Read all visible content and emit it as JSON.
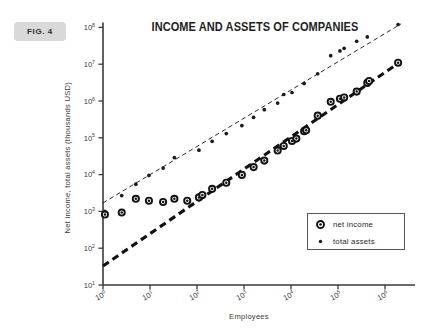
{
  "figure": {
    "badge_label": "FIG. 4",
    "title": "INCOME AND ASSETS OF COMPANIES"
  },
  "legend": {
    "position": "bottom-right",
    "entries": [
      {
        "label": "net income",
        "marker": "open-circle-donut",
        "color": "#111111"
      },
      {
        "label": "total assets",
        "marker": "small-filled-dot",
        "color": "#1a1a1a"
      }
    ]
  },
  "colors": {
    "background": "#ffffff",
    "axis": "#3a3a3a",
    "badge_fill": "#d9d9d9",
    "net_income": "#111111",
    "total_assets": "#1a1a1a"
  },
  "axes": {
    "x": {
      "label": "Employees",
      "scale": "log10",
      "min_exp": 0,
      "max_exp": 6,
      "tick_labels": [
        "10^0",
        "10^1",
        "10^2",
        "10^3",
        "10^4",
        "10^5",
        "10^6"
      ],
      "tick_mantissa": [
        "10",
        "10",
        "10",
        "10",
        "10",
        "10",
        "10"
      ],
      "tick_exponents": [
        "0",
        "1",
        "2",
        "3",
        "4",
        "5",
        "6"
      ]
    },
    "y": {
      "label": "Net income, total assets (thousands USD)",
      "scale": "log10",
      "min_exp": 1,
      "max_exp": 8,
      "tick_labels": [
        "10^8",
        "10^7",
        "10^6",
        "10^5",
        "10^4",
        "10^3",
        "10^2",
        "10^1"
      ],
      "tick_mantissa": [
        "10",
        "10",
        "10",
        "10",
        "10",
        "10",
        "10",
        "10"
      ],
      "tick_exponents": [
        "8",
        "7",
        "6",
        "5",
        "4",
        "3",
        "2",
        "1"
      ]
    },
    "grid": false
  },
  "chart_data": {
    "type": "scatter",
    "title": "INCOME AND ASSETS OF COMPANIES",
    "xlabel": "Employees",
    "ylabel": "Net income, total assets (thousands USD)",
    "xscale": "log",
    "yscale": "log",
    "xlim": [
      1,
      3000000
    ],
    "ylim": [
      10,
      200000000
    ],
    "grid": false,
    "legend_position": "lower right",
    "series": [
      {
        "name": "net income",
        "marker": "open-circle-donut",
        "points": [
          [
            1.1,
            820
          ],
          [
            2.5,
            930
          ],
          [
            5.0,
            2200
          ],
          [
            9.5,
            1950
          ],
          [
            19,
            1800
          ],
          [
            33,
            2200
          ],
          [
            62,
            1950
          ],
          [
            110,
            2400
          ],
          [
            130,
            2800
          ],
          [
            210,
            4100
          ],
          [
            420,
            6000
          ],
          [
            900,
            9800
          ],
          [
            1600,
            16000
          ],
          [
            2700,
            24000
          ],
          [
            5200,
            45000
          ],
          [
            7000,
            60000
          ],
          [
            10500,
            82000
          ],
          [
            13000,
            95000
          ],
          [
            19000,
            150000
          ],
          [
            21000,
            160000
          ],
          [
            37000,
            400000
          ],
          [
            70000,
            950000
          ],
          [
            110000,
            1150000
          ],
          [
            135000,
            1250000
          ],
          [
            250000,
            1800000
          ],
          [
            420000,
            3100000
          ],
          [
            460000,
            3500000
          ],
          [
            1900000,
            11000000
          ]
        ]
      },
      {
        "name": "total assets",
        "marker": "small-filled-dot",
        "points": [
          [
            1.1,
            1000
          ],
          [
            2.5,
            2700
          ],
          [
            5.0,
            5500
          ],
          [
            9.5,
            9500
          ],
          [
            19,
            15000
          ],
          [
            33,
            29000
          ],
          [
            110,
            46000
          ],
          [
            210,
            80000
          ],
          [
            420,
            130000
          ],
          [
            900,
            215000
          ],
          [
            1600,
            360000
          ],
          [
            2700,
            580000
          ],
          [
            5200,
            880000
          ],
          [
            7000,
            1500000
          ],
          [
            10500,
            1700000
          ],
          [
            19000,
            3000000
          ],
          [
            37000,
            5500000
          ],
          [
            70000,
            17000000
          ],
          [
            110000,
            23000000
          ],
          [
            135000,
            27000000
          ],
          [
            250000,
            42000000
          ],
          [
            420000,
            55000000
          ],
          [
            1900000,
            120000000
          ]
        ]
      }
    ],
    "trend_lines": [
      {
        "name": "net income trend",
        "style": "thick-dashed",
        "from": [
          1,
          33
        ],
        "to": [
          2200000,
          12000000
        ]
      },
      {
        "name": "total assets trend",
        "style": "thin-dashed",
        "from": [
          1,
          1700
        ],
        "to": [
          2200000,
          125000000
        ]
      }
    ]
  }
}
